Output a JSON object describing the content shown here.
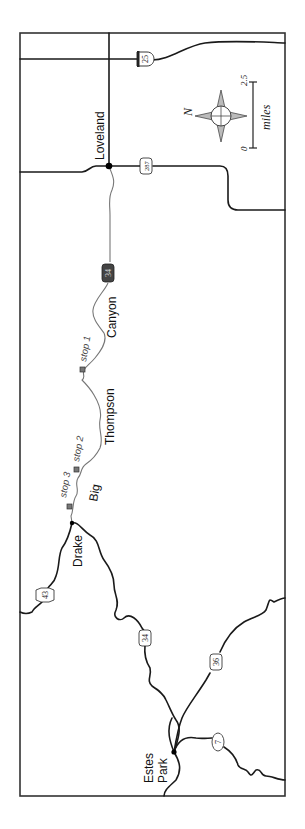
{
  "map": {
    "orientation": "rotated 90 degrees counter-clockwise",
    "towns": [
      {
        "name": "Loveland"
      },
      {
        "name": "Drake"
      },
      {
        "name": "Estes",
        "line2": "Park"
      }
    ],
    "canyon_label": {
      "word1": "Canyon",
      "word2": "Thompson",
      "word3": "Big"
    },
    "stops": [
      {
        "label": "stop 1"
      },
      {
        "label": "stop 2"
      },
      {
        "label": "stop 3"
      }
    ],
    "highway_shields": [
      {
        "number": "25",
        "type": "interstate"
      },
      {
        "number": "287",
        "type": "us"
      },
      {
        "number": "34",
        "type": "us",
        "style": "highlighted-dark"
      },
      {
        "number": "43",
        "type": "state-hexagon"
      },
      {
        "number": "34",
        "type": "us"
      },
      {
        "number": "36",
        "type": "us"
      },
      {
        "number": "7",
        "type": "state-oval"
      }
    ],
    "compass": {
      "north_label": "N"
    },
    "scale_bar": {
      "start": "0",
      "end": "2.5",
      "unit": "miles"
    },
    "colors": {
      "road": "#1a1a1a",
      "route": "#777777",
      "frame": "#333333",
      "highlight_shield": "#444444"
    }
  }
}
